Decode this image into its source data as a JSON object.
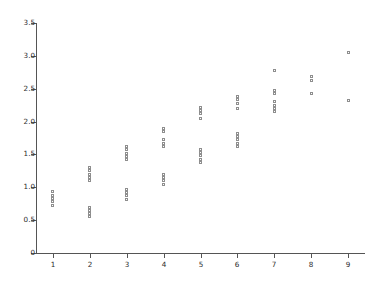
{
  "chart_data": {
    "type": "scatter",
    "title": "",
    "xlabel": "",
    "ylabel": "",
    "xlim": [
      0.55,
      9.45
    ],
    "ylim": [
      0,
      3.5
    ],
    "grid": false,
    "legend": null,
    "marker": "open-square",
    "marker_color": "#8e8e8e",
    "xticks": [
      1,
      2,
      3,
      4,
      5,
      6,
      7,
      8,
      9
    ],
    "xtick_labels": [
      "1",
      "2",
      "3",
      "4",
      "5",
      "6",
      "7",
      "8",
      "9"
    ],
    "yticks": [
      0,
      0.5,
      1.0,
      1.5,
      2.0,
      2.5,
      3.0,
      3.5
    ],
    "ytick_labels": [
      "0",
      "0.5",
      "1.0",
      "1.5",
      "2.0",
      "2.5",
      "3.0",
      "3.5"
    ],
    "points": [
      {
        "x": 1,
        "y": 0.93
      },
      {
        "x": 1,
        "y": 0.88
      },
      {
        "x": 1,
        "y": 0.83
      },
      {
        "x": 1,
        "y": 0.78
      },
      {
        "x": 1,
        "y": 0.73
      },
      {
        "x": 2,
        "y": 1.3
      },
      {
        "x": 2,
        "y": 1.25
      },
      {
        "x": 2,
        "y": 1.2
      },
      {
        "x": 2,
        "y": 1.15
      },
      {
        "x": 2,
        "y": 1.1
      },
      {
        "x": 2,
        "y": 0.7
      },
      {
        "x": 2,
        "y": 0.65
      },
      {
        "x": 2,
        "y": 0.6
      },
      {
        "x": 2,
        "y": 0.55
      },
      {
        "x": 3,
        "y": 1.62
      },
      {
        "x": 3,
        "y": 1.57
      },
      {
        "x": 3,
        "y": 1.52
      },
      {
        "x": 3,
        "y": 1.47
      },
      {
        "x": 3,
        "y": 1.42
      },
      {
        "x": 3,
        "y": 0.97
      },
      {
        "x": 3,
        "y": 0.92
      },
      {
        "x": 3,
        "y": 0.87
      },
      {
        "x": 3,
        "y": 0.82
      },
      {
        "x": 4,
        "y": 1.9
      },
      {
        "x": 4,
        "y": 1.85
      },
      {
        "x": 4,
        "y": 1.72
      },
      {
        "x": 4,
        "y": 1.67
      },
      {
        "x": 4,
        "y": 1.62
      },
      {
        "x": 4,
        "y": 1.2
      },
      {
        "x": 4,
        "y": 1.15
      },
      {
        "x": 4,
        "y": 1.1
      },
      {
        "x": 4,
        "y": 1.05
      },
      {
        "x": 5,
        "y": 2.22
      },
      {
        "x": 5,
        "y": 2.17
      },
      {
        "x": 5,
        "y": 2.12
      },
      {
        "x": 5,
        "y": 2.05
      },
      {
        "x": 5,
        "y": 1.58
      },
      {
        "x": 5,
        "y": 1.53
      },
      {
        "x": 5,
        "y": 1.48
      },
      {
        "x": 5,
        "y": 1.43
      },
      {
        "x": 5,
        "y": 1.38
      },
      {
        "x": 6,
        "y": 2.38
      },
      {
        "x": 6,
        "y": 2.33
      },
      {
        "x": 6,
        "y": 2.28
      },
      {
        "x": 6,
        "y": 2.2
      },
      {
        "x": 6,
        "y": 1.82
      },
      {
        "x": 6,
        "y": 1.77
      },
      {
        "x": 6,
        "y": 1.72
      },
      {
        "x": 6,
        "y": 1.67
      },
      {
        "x": 6,
        "y": 1.62
      },
      {
        "x": 7,
        "y": 2.78
      },
      {
        "x": 7,
        "y": 2.48
      },
      {
        "x": 7,
        "y": 2.43
      },
      {
        "x": 7,
        "y": 2.3
      },
      {
        "x": 7,
        "y": 2.25
      },
      {
        "x": 7,
        "y": 2.2
      },
      {
        "x": 7,
        "y": 2.15
      },
      {
        "x": 8,
        "y": 2.68
      },
      {
        "x": 8,
        "y": 2.63
      },
      {
        "x": 8,
        "y": 2.42
      },
      {
        "x": 9,
        "y": 3.05
      },
      {
        "x": 9,
        "y": 2.32
      }
    ]
  }
}
